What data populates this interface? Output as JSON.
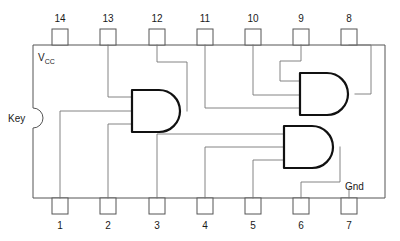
{
  "diagram": {
    "package_type": "DIP-14",
    "colors": {
      "outline": "#555555",
      "wire": "#777777",
      "gate": "#111111",
      "text": "#1a1a1a",
      "background": "#ffffff"
    },
    "labels": {
      "vcc": "V",
      "vcc_sub": "CC",
      "key": "Key",
      "gnd": "Gnd"
    },
    "pins_top": [
      {
        "number": "14",
        "x": 60
      },
      {
        "number": "13",
        "x": 108
      },
      {
        "number": "12",
        "x": 157
      },
      {
        "number": "11",
        "x": 205
      },
      {
        "number": "10",
        "x": 253
      },
      {
        "number": "9",
        "x": 301
      },
      {
        "number": "8",
        "x": 349
      }
    ],
    "pins_bottom": [
      {
        "number": "1",
        "x": 60
      },
      {
        "number": "2",
        "x": 108
      },
      {
        "number": "3",
        "x": 157
      },
      {
        "number": "4",
        "x": 205
      },
      {
        "number": "5",
        "x": 253
      },
      {
        "number": "6",
        "x": 301
      },
      {
        "number": "7",
        "x": 349
      }
    ],
    "gates": [
      {
        "name": "and-gate-1",
        "x": 132,
        "y": 90,
        "w": 55,
        "h": 42
      },
      {
        "name": "and-gate-2",
        "x": 300,
        "y": 73,
        "w": 55,
        "h": 42
      },
      {
        "name": "and-gate-3",
        "x": 284,
        "y": 126,
        "w": 56,
        "h": 42
      }
    ],
    "body": {
      "x": 33,
      "y": 45,
      "w": 352,
      "h": 153
    }
  }
}
